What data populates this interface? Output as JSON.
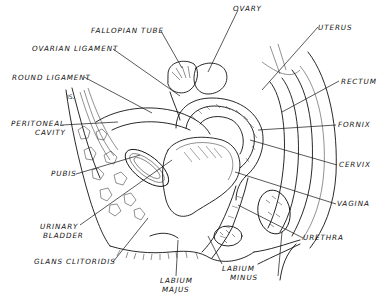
{
  "figure": {
    "type": "anatomical line drawing",
    "colors": {
      "ink": "#111111",
      "background": "#ffffff"
    }
  },
  "labels": {
    "ovary": "OVARY",
    "fallopian_tube": "FALLOPIAN TUBE",
    "uterus": "UTERUS",
    "ovarian_ligament": "OVARIAN LIGAMENT",
    "rectum": "RECTUM",
    "round_ligament": "ROUND LIGAMENT",
    "is_marker": "IS.",
    "peritoneal_cavity_1": "PERITONEAL",
    "peritoneal_cavity_2": "CAVITY",
    "fornix": "FORNIX",
    "pubis": "PUBIS",
    "cervix": "CERVIX",
    "vagina": "VAGINA",
    "urinary_bladder_1": "URINARY",
    "urinary_bladder_2": "BLADDER",
    "urethra": "URETHRA",
    "glans_clitoridis": "GLANS CLITORIDIS",
    "labium_minus_1": "LABIUM",
    "labium_minus_2": "MINUS",
    "labium_majus_1": "LABIUM",
    "labium_majus_2": "MAJUS"
  }
}
